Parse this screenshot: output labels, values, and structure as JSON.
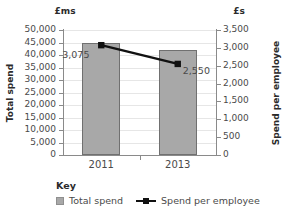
{
  "chart_data": {
    "type": "bar",
    "title": "",
    "subtitle": "",
    "categories": [
      "2011",
      "2013"
    ],
    "grid": true,
    "legend_position": "bottom",
    "legend_title": "Key",
    "unit_label_left": "£ms",
    "unit_label_right": "£s",
    "xlabel": "",
    "ylabel": "Total spend",
    "ylabel_right": "Spend per employee",
    "ylim": [
      0,
      50000
    ],
    "ylim_right": [
      0,
      3500
    ],
    "yticks": [
      "0",
      "5,000",
      "10,000",
      "15,000",
      "20,000",
      "25,000",
      "30,000",
      "35,000",
      "40,000",
      "45,000",
      "50,000"
    ],
    "yticks_right": [
      "0",
      "500",
      "1,000",
      "1,500",
      "2,000",
      "2,500",
      "3,000",
      "3,500"
    ],
    "series": [
      {
        "name": "Total spend",
        "type": "bar",
        "axis": "left",
        "color": "#a8a8a8",
        "values": [
          45000,
          42000
        ]
      },
      {
        "name": "Spend per employee",
        "type": "line",
        "axis": "right",
        "color": "#111111",
        "values": [
          3075,
          2550
        ],
        "data_labels": [
          "3,075",
          "2,550"
        ]
      }
    ]
  },
  "ytick_values_left": [
    0,
    5000,
    10000,
    15000,
    20000,
    25000,
    30000,
    35000,
    40000,
    45000,
    50000
  ],
  "ytick_values_right": [
    0,
    500,
    1000,
    1500,
    2000,
    2500,
    3000,
    3500
  ]
}
